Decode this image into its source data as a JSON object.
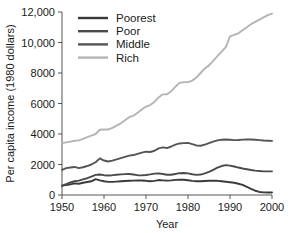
{
  "chart_data": {
    "type": "line",
    "title": "",
    "xlabel": "Year",
    "ylabel": "Per capita income (1980 dollars)",
    "xlim": [
      1950,
      2000
    ],
    "ylim": [
      0,
      12000
    ],
    "xticks": [
      1950,
      1960,
      1970,
      1980,
      1990,
      2000
    ],
    "xticklabels": [
      "1950",
      "1960",
      "1970",
      "1980",
      "1990",
      "2000"
    ],
    "yticks": [
      0,
      2000,
      4000,
      6000,
      8000,
      10000,
      12000
    ],
    "yticklabels": [
      "0",
      "2000",
      "4000",
      "6000",
      "8000",
      "10,000",
      "12,000"
    ],
    "grid": false,
    "legend_position": "upper left",
    "x": [
      1950,
      1951,
      1952,
      1953,
      1954,
      1955,
      1956,
      1957,
      1958,
      1959,
      1960,
      1961,
      1962,
      1963,
      1964,
      1965,
      1966,
      1967,
      1968,
      1969,
      1970,
      1971,
      1972,
      1973,
      1974,
      1975,
      1976,
      1977,
      1978,
      1979,
      1980,
      1981,
      1982,
      1983,
      1984,
      1985,
      1986,
      1987,
      1988,
      1989,
      1990,
      1991,
      1992,
      1993,
      1994,
      1995,
      1996,
      1997,
      1998,
      1999,
      2000
    ],
    "series": [
      {
        "name": "Poorest",
        "color": "#3a3a3a",
        "values": [
          600,
          660,
          700,
          760,
          740,
          800,
          850,
          900,
          1040,
          960,
          900,
          860,
          860,
          880,
          900,
          920,
          930,
          940,
          950,
          950,
          930,
          900,
          930,
          980,
          960,
          940,
          960,
          990,
          1010,
          1000,
          970,
          930,
          900,
          900,
          920,
          930,
          940,
          930,
          900,
          870,
          840,
          800,
          740,
          660,
          540,
          400,
          280,
          200,
          170,
          160,
          160
        ]
      },
      {
        "name": "Poor",
        "color": "#4a4a4a",
        "values": [
          620,
          720,
          820,
          900,
          940,
          1020,
          1100,
          1200,
          1320,
          1340,
          1300,
          1280,
          1300,
          1330,
          1350,
          1370,
          1380,
          1340,
          1300,
          1290,
          1310,
          1350,
          1400,
          1420,
          1380,
          1330,
          1330,
          1380,
          1430,
          1440,
          1420,
          1360,
          1320,
          1340,
          1420,
          1520,
          1650,
          1790,
          1900,
          1960,
          1930,
          1870,
          1800,
          1740,
          1690,
          1640,
          1600,
          1570,
          1550,
          1550,
          1550
        ]
      },
      {
        "name": "Middle",
        "color": "#555555",
        "values": [
          1650,
          1760,
          1800,
          1840,
          1760,
          1820,
          1900,
          2000,
          2150,
          2400,
          2260,
          2200,
          2250,
          2340,
          2420,
          2500,
          2580,
          2620,
          2700,
          2780,
          2840,
          2820,
          2900,
          3060,
          3120,
          3080,
          3180,
          3300,
          3380,
          3400,
          3420,
          3340,
          3250,
          3230,
          3300,
          3400,
          3500,
          3580,
          3620,
          3640,
          3620,
          3600,
          3610,
          3630,
          3640,
          3640,
          3620,
          3600,
          3570,
          3560,
          3550
        ]
      },
      {
        "name": "Rich",
        "color": "#b4b4b4",
        "values": [
          3400,
          3450,
          3500,
          3560,
          3580,
          3680,
          3800,
          3900,
          4000,
          4280,
          4300,
          4300,
          4400,
          4550,
          4700,
          4900,
          5100,
          5200,
          5400,
          5600,
          5800,
          5900,
          6100,
          6400,
          6600,
          6600,
          6800,
          7100,
          7350,
          7400,
          7400,
          7500,
          7700,
          8000,
          8300,
          8500,
          8800,
          9100,
          9400,
          9700,
          10400,
          10500,
          10600,
          10800,
          11000,
          11200,
          11350,
          11500,
          11650,
          11800,
          11900
        ]
      }
    ]
  },
  "legend": {
    "items": [
      {
        "label": "Poorest"
      },
      {
        "label": "Poor"
      },
      {
        "label": "Middle"
      },
      {
        "label": "Rich"
      }
    ]
  }
}
